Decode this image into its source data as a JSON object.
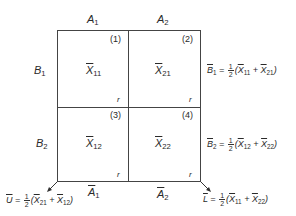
{
  "diagram": {
    "columns": [
      {
        "label_main": "A",
        "label_sub": "1"
      },
      {
        "label_main": "A",
        "label_sub": "2"
      }
    ],
    "rows": [
      {
        "label_main": "B",
        "label_sub": "1"
      },
      {
        "label_main": "B",
        "label_sub": "2"
      }
    ],
    "cells": [
      {
        "index": "(1)",
        "mean_main": "X",
        "mean_sub": "11",
        "r": "r"
      },
      {
        "index": "(2)",
        "mean_main": "X",
        "mean_sub": "21",
        "r": "r"
      },
      {
        "index": "(3)",
        "mean_main": "X",
        "mean_sub": "12",
        "r": "r"
      },
      {
        "index": "(4)",
        "mean_main": "X",
        "mean_sub": "22",
        "r": "r"
      }
    ],
    "row_means": [
      {
        "lhs_main": "B",
        "lhs_sub": "1",
        "eq": "=",
        "frac_num": "1",
        "frac_den": "2",
        "open": "(",
        "t1_main": "X",
        "t1_sub": "11",
        "plus": "+",
        "t2_main": "X",
        "t2_sub": "21",
        "close": ")"
      },
      {
        "lhs_main": "B",
        "lhs_sub": "2",
        "eq": "=",
        "frac_num": "1",
        "frac_den": "2",
        "open": "(",
        "t1_main": "X",
        "t1_sub": "12",
        "plus": "+",
        "t2_main": "X",
        "t2_sub": "22",
        "close": ")"
      }
    ],
    "column_means": [
      {
        "main": "A",
        "sub": "1"
      },
      {
        "main": "A",
        "sub": "2"
      }
    ],
    "diagonal_means": {
      "U": {
        "lhs": "U",
        "eq": "=",
        "frac_num": "1",
        "frac_den": "2",
        "open": "(",
        "t1_main": "X",
        "t1_sub": "21",
        "plus": "+",
        "t2_main": "X",
        "t2_sub": "12",
        "close": ")"
      },
      "L": {
        "lhs": "L",
        "eq": "=",
        "frac_num": "1",
        "frac_den": "2",
        "open": "(",
        "t1_main": "X",
        "t1_sub": "11",
        "plus": "+",
        "t2_main": "X",
        "t2_sub": "22",
        "close": ")"
      }
    }
  }
}
